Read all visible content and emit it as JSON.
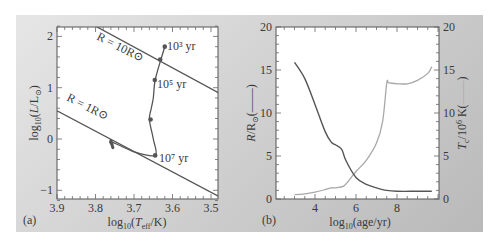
{
  "figure": {
    "panel_a_label": "(a)",
    "panel_b_label": "(b)"
  },
  "panel_a": {
    "xlabel": "log10(Teff/K)",
    "ylabel": "log10(L/L⊙)",
    "xticks": [
      "3.9",
      "3.8",
      "3.7",
      "3.6",
      "3.5"
    ],
    "yticks": [
      "2",
      "1",
      "0",
      "−1"
    ],
    "annotations": {
      "r10": "R = 10R⊙",
      "r1": "R = 1R⊙",
      "t3": "10³ yr",
      "t5": "10⁵ yr",
      "t7": "10⁷ yr"
    }
  },
  "panel_b": {
    "xlabel": "log10(age/yr)",
    "ylabel_left": "R/R⊙ (——)",
    "ylabel_right": "Tc/10⁶ K (——)",
    "xticks": [
      "4",
      "6",
      "8"
    ],
    "yticks_left": [
      "20",
      "15",
      "10",
      "5",
      "0"
    ],
    "yticks_right": [
      "20",
      "15",
      "10",
      "5",
      "0"
    ]
  },
  "colors": {
    "panel_bg": "#cfcfcf",
    "plot_bg": "#ffffff",
    "dark_line": "#555555",
    "light_line": "#a8a8a8",
    "text": "#3a3a3a"
  },
  "chart_data": [
    {
      "type": "line",
      "title": "(a) Pre-main-sequence track in HR diagram",
      "xlabel": "log10(Teff/K)",
      "ylabel": "log10(L/L⊙)",
      "xlim": [
        3.9,
        3.48
      ],
      "ylim": [
        -1.2,
        2.2
      ],
      "x_reversed": true,
      "grid": false,
      "series": [
        {
          "name": "evolutionary track",
          "x": [
            3.62,
            3.63,
            3.645,
            3.65,
            3.655,
            3.66,
            3.65,
            3.645,
            3.7,
            3.76,
            3.755
          ],
          "y": [
            1.8,
            1.55,
            1.15,
            0.8,
            0.6,
            0.38,
            0.0,
            -0.32,
            -0.25,
            -0.05,
            -0.15
          ]
        },
        {
          "name": "R = 10R⊙",
          "x": [
            3.8,
            3.48
          ],
          "y": [
            2.2,
            0.9
          ]
        },
        {
          "name": "R = 1R⊙",
          "x": [
            3.9,
            3.48
          ],
          "y": [
            0.55,
            -1.12
          ]
        }
      ],
      "markers": [
        {
          "label": "10³ yr",
          "x": 3.62,
          "y": 1.8
        },
        {
          "x": 3.632,
          "y": 1.55
        },
        {
          "label": "10⁵ yr",
          "x": 3.646,
          "y": 1.15
        },
        {
          "x": 3.657,
          "y": 0.38
        },
        {
          "label": "10⁷ yr",
          "x": 3.645,
          "y": -0.32
        }
      ]
    },
    {
      "type": "line",
      "title": "(b) Radius and central temperature vs age",
      "xlabel": "log10(age/yr)",
      "ylabel": "R/R⊙",
      "ylabel_right": "Tc/10⁶ K",
      "xlim": [
        2.1,
        10.05
      ],
      "ylim": [
        0,
        20
      ],
      "grid": false,
      "series": [
        {
          "name": "R/R⊙ (dark)",
          "x": [
            3.0,
            3.5,
            4.0,
            4.5,
            4.8,
            5.0,
            5.3,
            5.5,
            6.0,
            6.5,
            7.0,
            7.5,
            8.0,
            9.0,
            9.7
          ],
          "y": [
            15.9,
            14.0,
            11.0,
            7.8,
            6.6,
            6.3,
            5.8,
            4.5,
            2.5,
            1.7,
            1.3,
            1.0,
            0.9,
            0.9,
            0.9
          ]
        },
        {
          "name": "Tc/10⁶ K (light)",
          "x": [
            3.0,
            3.5,
            4.0,
            4.5,
            4.8,
            5.0,
            5.4,
            5.7,
            6.0,
            6.5,
            7.0,
            7.3,
            7.5,
            7.6,
            8.0,
            8.5,
            9.0,
            9.5,
            9.7
          ],
          "y": [
            0.5,
            0.6,
            0.8,
            1.1,
            1.3,
            1.3,
            1.5,
            2.3,
            3.2,
            4.5,
            6.5,
            9.0,
            13.5,
            13.5,
            13.4,
            13.4,
            13.8,
            14.6,
            15.4
          ]
        }
      ]
    }
  ]
}
